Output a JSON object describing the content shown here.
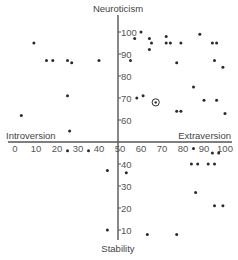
{
  "chart_data": {
    "type": "scatter",
    "title": "",
    "xlabel_left": "Introversion",
    "xlabel_right": "Extraversion",
    "ylabel_top": "Neuroticism",
    "ylabel_bottom": "Stability",
    "xlim": [
      0,
      100
    ],
    "ylim": [
      0,
      100
    ],
    "axes_cross_at": [
      50,
      50
    ],
    "grid": false,
    "legend": null,
    "x_ticks": [
      0,
      10,
      20,
      30,
      40,
      50,
      60,
      70,
      80,
      90,
      100
    ],
    "y_ticks_upper": [
      100,
      90,
      80,
      70,
      60
    ],
    "y_ticks_lower": [
      40,
      30,
      20,
      10
    ],
    "series": [
      {
        "name": "individuals",
        "points": [
          {
            "x": 9,
            "y": 95
          },
          {
            "x": 15,
            "y": 87
          },
          {
            "x": 18,
            "y": 87
          },
          {
            "x": 25,
            "y": 87
          },
          {
            "x": 27,
            "y": 86
          },
          {
            "x": 40,
            "y": 87
          },
          {
            "x": 25,
            "y": 71
          },
          {
            "x": 3,
            "y": 62
          },
          {
            "x": 26,
            "y": 55
          },
          {
            "x": 60,
            "y": 100
          },
          {
            "x": 57,
            "y": 97
          },
          {
            "x": 64,
            "y": 97
          },
          {
            "x": 65,
            "y": 95
          },
          {
            "x": 64,
            "y": 92
          },
          {
            "x": 72,
            "y": 98
          },
          {
            "x": 72,
            "y": 95
          },
          {
            "x": 74,
            "y": 95
          },
          {
            "x": 79,
            "y": 95
          },
          {
            "x": 88,
            "y": 99
          },
          {
            "x": 94,
            "y": 95
          },
          {
            "x": 96,
            "y": 95
          },
          {
            "x": 55,
            "y": 87
          },
          {
            "x": 77,
            "y": 86
          },
          {
            "x": 95,
            "y": 87
          },
          {
            "x": 99,
            "y": 84
          },
          {
            "x": 85,
            "y": 75
          },
          {
            "x": 58,
            "y": 70
          },
          {
            "x": 61,
            "y": 71
          },
          {
            "x": 90,
            "y": 69
          },
          {
            "x": 96,
            "y": 69
          },
          {
            "x": 77,
            "y": 64
          },
          {
            "x": 79,
            "y": 64
          },
          {
            "x": 100,
            "y": 63
          },
          {
            "x": 25,
            "y": 46
          },
          {
            "x": 35,
            "y": 46
          },
          {
            "x": 44,
            "y": 37
          },
          {
            "x": 44,
            "y": 10
          },
          {
            "x": 53,
            "y": 36
          },
          {
            "x": 85,
            "y": 47
          },
          {
            "x": 94,
            "y": 45
          },
          {
            "x": 97,
            "y": 45
          },
          {
            "x": 84,
            "y": 40
          },
          {
            "x": 87,
            "y": 40
          },
          {
            "x": 92,
            "y": 40
          },
          {
            "x": 95,
            "y": 40
          },
          {
            "x": 86,
            "y": 27
          },
          {
            "x": 95,
            "y": 21
          },
          {
            "x": 99,
            "y": 21
          },
          {
            "x": 63,
            "y": 8
          },
          {
            "x": 77,
            "y": 8
          }
        ]
      },
      {
        "name": "highlighted",
        "marker": "circled",
        "points": [
          {
            "x": 67,
            "y": 68
          }
        ]
      }
    ]
  },
  "labels": {
    "neuroticism": "Neuroticism",
    "stability": "Stability",
    "introversion": "Introversion",
    "extraversion": "Extraversion"
  }
}
